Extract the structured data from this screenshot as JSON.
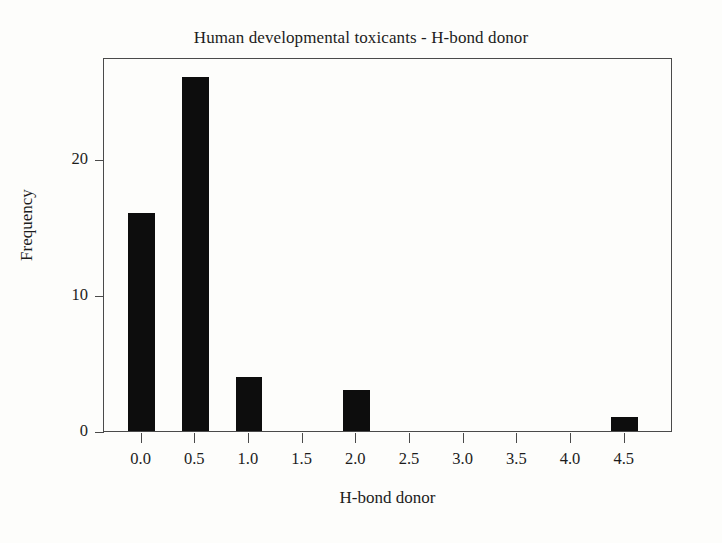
{
  "chart_data": {
    "type": "bar",
    "title": "Human developmental toxicants - H-bond donor",
    "xlabel": "H-bond donor",
    "ylabel": "Frequency",
    "categories": [
      "0.0",
      "0.5",
      "1.0",
      "2.0",
      "4.5"
    ],
    "x": [
      0.0,
      0.5,
      1.0,
      2.0,
      4.5
    ],
    "values": [
      16,
      26,
      4,
      3,
      1
    ],
    "bar_color": "#0d0d0d",
    "bar_width": 0.25,
    "xlim": [
      -0.35,
      4.95
    ],
    "ylim": [
      0,
      27.5
    ],
    "xticks": [
      "0.0",
      "0.5",
      "1.0",
      "1.5",
      "2.0",
      "2.5",
      "3.0",
      "3.5",
      "4.0",
      "4.5"
    ],
    "xtick_values": [
      0.0,
      0.5,
      1.0,
      1.5,
      2.0,
      2.5,
      3.0,
      3.5,
      4.0,
      4.5
    ],
    "yticks": [
      "0",
      "10",
      "20"
    ],
    "ytick_values": [
      0,
      10,
      20
    ],
    "grid": false,
    "legend": false,
    "frame": true,
    "background": "#fdfdfb",
    "axis_color": "#4a4a4a"
  }
}
